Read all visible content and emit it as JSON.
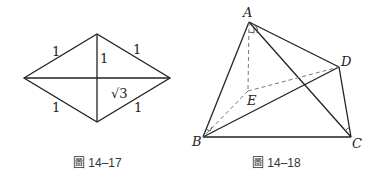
{
  "figures": [
    {
      "caption": "圖 14–17",
      "type": "rhombus",
      "labels": {
        "top_left_side": "1",
        "top_right_side": "1",
        "bottom_left_side": "1",
        "bottom_right_side": "1",
        "vertical_diagonal_half": "1",
        "horizontal_diagonal_half": "√3"
      }
    },
    {
      "caption": "圖 14–18",
      "type": "tetrahedron",
      "vertices": {
        "A": "A",
        "B": "B",
        "C": "C",
        "D": "D",
        "E": "E"
      }
    }
  ]
}
